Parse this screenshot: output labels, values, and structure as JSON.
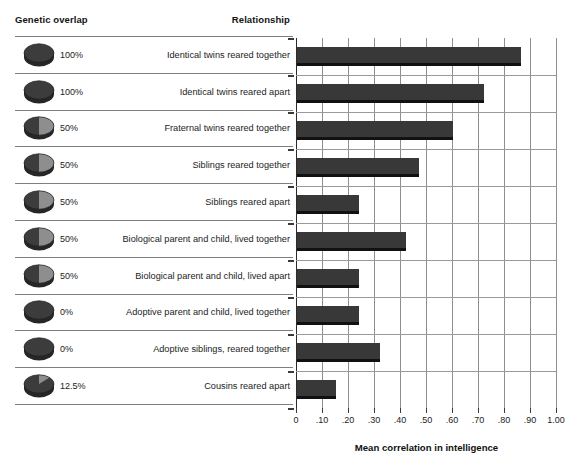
{
  "headers": {
    "genetic_overlap": "Genetic overlap",
    "relationship": "Relationship"
  },
  "chart_data": {
    "type": "bar",
    "orientation": "horizontal",
    "title": "",
    "xlabel": "Mean correlation in intelligence",
    "ylabel": "",
    "xlim": [
      0,
      1.0
    ],
    "xticks": [
      0,
      0.1,
      0.2,
      0.3,
      0.4,
      0.5,
      0.6,
      0.7,
      0.8,
      0.9,
      1.0
    ],
    "xticklabels": [
      "0",
      ".10",
      ".20",
      ".30",
      ".40",
      ".50",
      ".60",
      ".70",
      ".80",
      ".90",
      "1.00"
    ],
    "grid": "vertical",
    "legend": "none",
    "bar_color": "#383838",
    "categories": [
      "Identical twins reared together",
      "Identical twins reared apart",
      "Fraternal twins reared together",
      "Siblings reared together",
      "Siblings reared apart",
      "Biological parent and child, lived together",
      "Biological parent and child, lived apart",
      "Adoptive parent and child, lived together",
      "Adoptive siblings, reared together",
      "Cousins reared apart"
    ],
    "values": [
      0.86,
      0.72,
      0.6,
      0.47,
      0.24,
      0.42,
      0.24,
      0.24,
      0.32,
      0.15
    ],
    "genetic_overlap": [
      "100%",
      "100%",
      "50%",
      "50%",
      "50%",
      "50%",
      "50%",
      "0%",
      "0%",
      "12.5%"
    ],
    "genetic_overlap_fraction": [
      1.0,
      1.0,
      0.5,
      0.5,
      0.5,
      0.5,
      0.5,
      0.0,
      0.0,
      0.125
    ]
  },
  "rows": [
    {
      "overlap": "100%",
      "fraction": 1.0,
      "label": "Identical twins reared together",
      "value": 0.86,
      "icon": "pie-disc-icon"
    },
    {
      "overlap": "100%",
      "fraction": 1.0,
      "label": "Identical twins reared apart",
      "value": 0.72,
      "icon": "pie-disc-icon"
    },
    {
      "overlap": "50%",
      "fraction": 0.5,
      "label": "Fraternal twins reared together",
      "value": 0.6,
      "icon": "pie-disc-icon"
    },
    {
      "overlap": "50%",
      "fraction": 0.5,
      "label": "Siblings reared together",
      "value": 0.47,
      "icon": "pie-disc-icon"
    },
    {
      "overlap": "50%",
      "fraction": 0.5,
      "label": "Siblings reared apart",
      "value": 0.24,
      "icon": "pie-disc-icon"
    },
    {
      "overlap": "50%",
      "fraction": 0.5,
      "label": "Biological parent and child, lived together",
      "value": 0.42,
      "icon": "pie-disc-icon"
    },
    {
      "overlap": "50%",
      "fraction": 0.5,
      "label": "Biological parent and child, lived apart",
      "value": 0.24,
      "icon": "pie-disc-icon"
    },
    {
      "overlap": "0%",
      "fraction": 0.0,
      "label": "Adoptive parent and child, lived together",
      "value": 0.24,
      "icon": "pie-disc-icon"
    },
    {
      "overlap": "0%",
      "fraction": 0.0,
      "label": "Adoptive siblings, reared together",
      "value": 0.32,
      "icon": "pie-disc-icon"
    },
    {
      "overlap": "12.5%",
      "fraction": 0.125,
      "label": "Cousins reared apart",
      "value": 0.15,
      "icon": "pie-disc-icon"
    }
  ]
}
